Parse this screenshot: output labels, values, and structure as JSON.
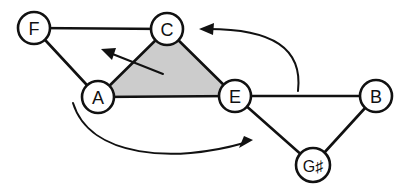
{
  "figure": {
    "background_color": "#ffffff",
    "stroke_color": "#111111",
    "region_fill_color": "#cccccc"
  },
  "nodes": [
    {
      "id": "F",
      "label": "F",
      "x": 34,
      "y": 28,
      "r": 16
    },
    {
      "id": "C",
      "label": "C",
      "x": 167,
      "y": 29,
      "r": 16
    },
    {
      "id": "A",
      "label": "A",
      "x": 98,
      "y": 97,
      "r": 16
    },
    {
      "id": "E",
      "label": "E",
      "x": 235,
      "y": 96,
      "r": 16
    },
    {
      "id": "B",
      "label": "B",
      "x": 376,
      "y": 96,
      "r": 16
    },
    {
      "id": "Gs",
      "label": "G♯",
      "x": 313,
      "y": 165,
      "r": 17
    }
  ],
  "edges": [
    {
      "from": "F",
      "to": "C"
    },
    {
      "from": "F",
      "to": "A"
    },
    {
      "from": "A",
      "to": "C"
    },
    {
      "from": "C",
      "to": "E"
    },
    {
      "from": "A",
      "to": "E"
    },
    {
      "from": "E",
      "to": "B"
    },
    {
      "from": "E",
      "to": "Gs"
    },
    {
      "from": "B",
      "to": "Gs"
    }
  ],
  "shaded_regions": [
    {
      "name": "triangle-a-c-e",
      "vertices": [
        "A",
        "C",
        "E"
      ],
      "fill": "#cccccc"
    }
  ],
  "annotations": [
    {
      "name": "straight-arrow-into-triangle",
      "kind": "straight",
      "from_x": 163,
      "from_y": 74,
      "to_x": 104,
      "to_y": 51
    },
    {
      "name": "curved-arrow-upper",
      "kind": "curved",
      "from_x": 298,
      "from_y": 91,
      "ctrl_x": 300,
      "ctrl_y": 26,
      "to_x": 201,
      "to_y": 29
    },
    {
      "name": "curved-arrow-lower",
      "kind": "curved",
      "from_x": 73,
      "from_y": 103,
      "ctrl_x": 158,
      "ctrl_y": 168,
      "to_x": 252,
      "to_y": 146
    }
  ]
}
